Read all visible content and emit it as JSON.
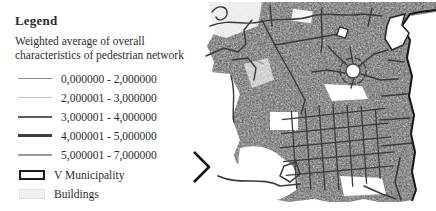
{
  "legend": {
    "title": "Legend",
    "subtitle": "Weighted average of overall characteristics of pedestrian network",
    "items": [
      {
        "label": "0,000000 - 2,000000",
        "color": "#8a8a8a",
        "weight": 1.5
      },
      {
        "label": "2,000001 - 3,000000",
        "color": "#c9c9c9",
        "weight": 1.5
      },
      {
        "label": "3,000001 - 4,000000",
        "color": "#5c5c5c",
        "weight": 2
      },
      {
        "label": "4,000001 - 5,000000",
        "color": "#3d3d3d",
        "weight": 2.5
      },
      {
        "label": "5,000001 - 7,000000",
        "color": "#9b9b9b",
        "weight": 2
      }
    ],
    "area_items": [
      {
        "label": "V Municipality",
        "fill": "#ffffff",
        "border_color": "#1c1c1c"
      },
      {
        "label": "Buildings",
        "fill": "#f1f1ee",
        "border_color": "#e0e0dd"
      }
    ]
  },
  "map": {
    "description": "Grayscale street map of the municipality showing the weighted pedestrian network",
    "background": "#ffffff",
    "building_texture_color": "#c3c3c3",
    "road_color": "#3a3a3a",
    "boundary_color": "#161616"
  }
}
